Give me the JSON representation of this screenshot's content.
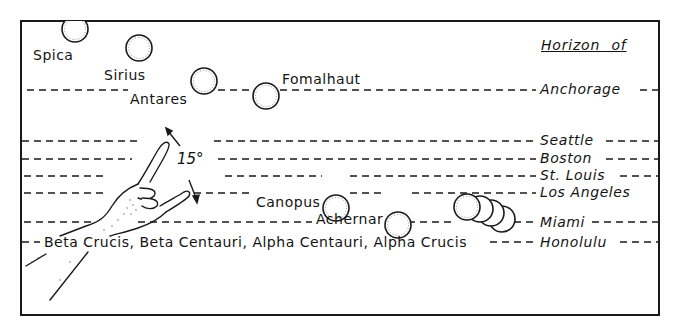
{
  "diagram": {
    "header": "Horizon of",
    "angle_label": "15°",
    "stars": [
      {
        "name": "Spica",
        "label": "Spica"
      },
      {
        "name": "Sirius",
        "label": "Sirius"
      },
      {
        "name": "Antares",
        "label": "Antares"
      },
      {
        "name": "Fomalhaut",
        "label": "Fomalhaut"
      },
      {
        "name": "Canopus",
        "label": "Canopus"
      },
      {
        "name": "Achernar",
        "label": "Achernar"
      }
    ],
    "southern_cross_label": "Beta Crucis, Beta Centauri, Alpha Centauri, Alpha Crucis",
    "horizons": [
      {
        "city": "Anchorage"
      },
      {
        "city": "Seattle"
      },
      {
        "city": "Boston"
      },
      {
        "city": "St. Louis"
      },
      {
        "city": "Los Angeles"
      },
      {
        "city": "Miami"
      },
      {
        "city": "Honolulu"
      }
    ],
    "icons": [
      "hand-icon",
      "double-arrow-icon"
    ],
    "colors": {
      "ink": "#1a1a1a",
      "background": "#ffffff"
    }
  }
}
